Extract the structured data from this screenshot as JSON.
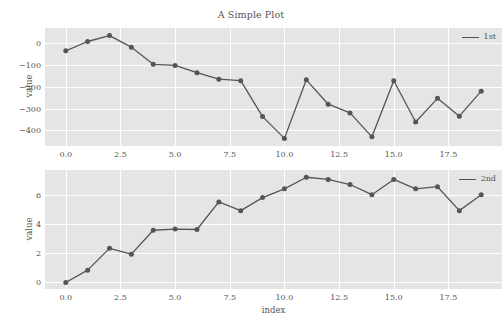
{
  "figure": {
    "title": "A Simple Plot",
    "background_color": "#ffffff",
    "axes_facecolor": "#E5E5E5",
    "grid_color": "#FFFFFF",
    "line_color": "#555555",
    "text_color": "#555555"
  },
  "chart_data": [
    {
      "type": "line",
      "title": "A Simple Plot",
      "xlabel": "",
      "ylabel": "value",
      "legend": [
        "1st"
      ],
      "legend_position": "upper right",
      "grid": true,
      "xlim": [
        -0.95,
        19.95
      ],
      "ylim": [
        -472,
        70
      ],
      "xticks": [
        0.0,
        2.5,
        5.0,
        7.5,
        10.0,
        12.5,
        15.0,
        17.5
      ],
      "xticklabels": [
        "0.0",
        "2.5",
        "5.0",
        "7.5",
        "10.0",
        "12.5",
        "15.0",
        "17.5"
      ],
      "yticks": [
        0,
        -100,
        -200,
        -300,
        -400
      ],
      "yticklabels": [
        "0",
        "−100",
        "−200",
        "−300",
        "−400"
      ],
      "x": [
        0,
        1,
        2,
        3,
        4,
        5,
        6,
        7,
        8,
        9,
        10,
        11,
        12,
        13,
        14,
        15,
        16,
        17,
        18,
        19
      ],
      "series": [
        {
          "name": "1st",
          "marker": "circle",
          "values": [
            -35,
            8,
            35,
            -18,
            -97,
            -102,
            -135,
            -165,
            -172,
            -337,
            -437,
            -168,
            -280,
            -320,
            -430,
            -172,
            -362,
            -253,
            -335,
            -220
          ]
        }
      ]
    },
    {
      "type": "line",
      "title": "",
      "xlabel": "index",
      "ylabel": "value",
      "legend": [
        "2nd"
      ],
      "legend_position": "upper right",
      "grid": true,
      "xlim": [
        -0.95,
        19.95
      ],
      "ylim": [
        -0.45,
        7.75
      ],
      "xticks": [
        0.0,
        2.5,
        5.0,
        7.5,
        10.0,
        12.5,
        15.0,
        17.5
      ],
      "xticklabels": [
        "0.0",
        "2.5",
        "5.0",
        "7.5",
        "10.0",
        "12.5",
        "15.0",
        "17.5"
      ],
      "yticks": [
        0,
        2,
        4,
        6
      ],
      "yticklabels": [
        "0",
        "2",
        "4",
        "6"
      ],
      "x": [
        0,
        1,
        2,
        3,
        4,
        5,
        6,
        7,
        8,
        9,
        10,
        11,
        12,
        13,
        14,
        15,
        16,
        17,
        18,
        19
      ],
      "series": [
        {
          "name": "2nd",
          "marker": "circle",
          "values": [
            0.0,
            0.85,
            2.35,
            1.95,
            3.6,
            3.68,
            3.65,
            5.55,
            4.95,
            5.85,
            6.45,
            7.25,
            7.1,
            6.75,
            6.05,
            7.1,
            6.45,
            6.6,
            4.95,
            6.05
          ]
        }
      ]
    }
  ]
}
